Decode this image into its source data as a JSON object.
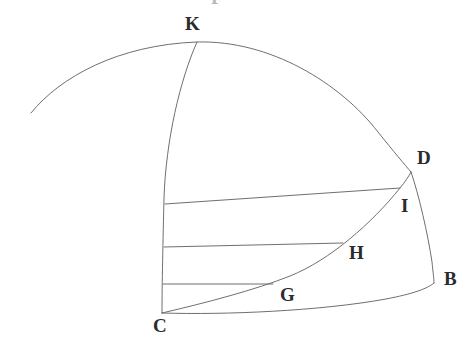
{
  "figure": {
    "background_color": "#ffffff",
    "stroke_color": "#6f6f6f",
    "label_color": "#2b2b2b",
    "stroke_width": 1,
    "width": 476,
    "height": 353,
    "top_fragment_text": "F"
  },
  "points": [
    {
      "id": "K",
      "label": "K",
      "x": 197,
      "y": 42,
      "label_x": 185,
      "label_y": 14
    },
    {
      "id": "D",
      "label": "D",
      "x": 411,
      "y": 172,
      "label_x": 417,
      "label_y": 148
    },
    {
      "id": "I",
      "label": "I",
      "x": 400,
      "y": 188,
      "label_x": 401,
      "label_y": 196
    },
    {
      "id": "B",
      "label": "B",
      "x": 434,
      "y": 283,
      "label_x": 444,
      "label_y": 269
    },
    {
      "id": "H",
      "label": "H",
      "x": 343,
      "y": 243,
      "label_x": 349,
      "label_y": 243
    },
    {
      "id": "G",
      "label": "G",
      "x": 273,
      "y": 284,
      "label_x": 280,
      "label_y": 285
    },
    {
      "id": "C",
      "label": "C",
      "x": 162,
      "y": 313,
      "label_x": 153,
      "label_y": 316
    }
  ],
  "curves": [
    {
      "id": "outer-dome-arc",
      "name": "outer-dome-arc",
      "description": "Large arc sweeping from lower-left up through K and down to D",
      "path": "M 31 113 C 60 77 118 45 197 42 C 270 40 340 83 378 132 C 394 152 405 165 411 172"
    },
    {
      "id": "radius-arc-k-c",
      "name": "radius-arc-k-to-c",
      "description": "Curve from K down the left side to vertex C",
      "path": "M 197 42 C 180 80 166 140 164 198 C 163 240 162 285 162 313"
    },
    {
      "id": "arc-d-to-b",
      "name": "arc-d-to-b",
      "description": "Right boundary arc from D through I region down to B",
      "path": "M 411 172 C 419 195 428 235 432 262 C 433 272 434 279 434 283"
    },
    {
      "id": "arc-c-to-b",
      "name": "arc-c-to-b-base",
      "description": "Lower boundary arc from vertex C sweeping right and up to B",
      "path": "M 162 313 C 225 315 320 311 386 299 C 412 294 427 289 434 283"
    },
    {
      "id": "curve-c-g-h-i",
      "name": "curve-c-g-h-i-d",
      "description": "Inner rising curve from C through G, H, I up to D",
      "path": "M 162 313 C 205 303 255 290 290 276 C 330 260 372 223 400 188 C 405 182 409 176 411 172"
    }
  ],
  "chords": [
    {
      "id": "chord-i",
      "name": "chord-top-to-i",
      "from_x": 165,
      "from_y": 204,
      "to_x": 400,
      "to_y": 188
    },
    {
      "id": "chord-h",
      "name": "chord-mid-to-h",
      "from_x": 164,
      "from_y": 247,
      "to_x": 343,
      "to_y": 243
    },
    {
      "id": "chord-g",
      "name": "chord-low-to-g",
      "from_x": 163,
      "from_y": 284,
      "to_x": 273,
      "to_y": 284
    }
  ]
}
